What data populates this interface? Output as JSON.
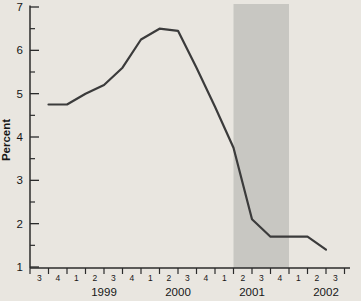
{
  "chart_data": {
    "type": "line",
    "title": "",
    "xlabel": "",
    "ylabel": "Percent",
    "ylim": [
      1,
      7
    ],
    "y_major_ticks": [
      1,
      2,
      3,
      4,
      5,
      6,
      7
    ],
    "y_minor_tick_step": 0.5,
    "grid": "off",
    "legend": "none",
    "x_quarter_labels": [
      "3",
      "4",
      "1",
      "2",
      "3",
      "4",
      "1",
      "2",
      "3",
      "4",
      "1",
      "2",
      "3",
      "4",
      "1",
      "2",
      "3"
    ],
    "x_year_labels": [
      {
        "label": "1999",
        "center_boundary": 4
      },
      {
        "label": "2000",
        "center_boundary": 8
      },
      {
        "label": "2001",
        "center_boundary": 12
      },
      {
        "label": "2002",
        "center_boundary": 16
      }
    ],
    "series": [
      {
        "name": "percent-rate-line",
        "first_point_boundary_index": 1,
        "points": [
          {
            "quarter": "1998Q4",
            "value": 4.75
          },
          {
            "quarter": "1999Q1",
            "value": 4.75
          },
          {
            "quarter": "1999Q2",
            "value": 5.0
          },
          {
            "quarter": "1999Q3",
            "value": 5.2
          },
          {
            "quarter": "1999Q4",
            "value": 5.6
          },
          {
            "quarter": "2000Q1",
            "value": 6.25
          },
          {
            "quarter": "2000Q2",
            "value": 6.5
          },
          {
            "quarter": "2000Q3",
            "value": 6.45
          },
          {
            "quarter": "2000Q4",
            "value": 5.6
          },
          {
            "quarter": "2001Q1",
            "value": 4.7
          },
          {
            "quarter": "2001Q2",
            "value": 3.75
          },
          {
            "quarter": "2001Q3",
            "value": 2.1
          },
          {
            "quarter": "2001Q4",
            "value": 1.7
          },
          {
            "quarter": "2002Q1",
            "value": 1.7
          },
          {
            "quarter": "2002Q2",
            "value": 1.7
          },
          {
            "quarter": "2002Q3",
            "value": 1.4
          }
        ]
      }
    ],
    "shaded_band": {
      "start_boundary_index": 11,
      "end_boundary_index": 14,
      "start_quarter": "2001Q2",
      "end_quarter": "2001Q4"
    },
    "colors": {
      "background": "#e9e6e0",
      "band": "#c8c7c2",
      "line": "#3b3b3b",
      "axis": "#2b2b2b",
      "text": "#161616"
    }
  }
}
